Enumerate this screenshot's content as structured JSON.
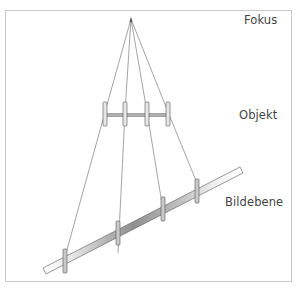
{
  "labels": {
    "focus": "Fokus",
    "object": "Objekt",
    "image_plane": "Bildebene"
  },
  "colors": {
    "border": "#c8c8c8",
    "line": "#555555",
    "bar_fill": "#d9d9d9",
    "bar_dark": "#8a8a8a",
    "text": "#444444"
  }
}
